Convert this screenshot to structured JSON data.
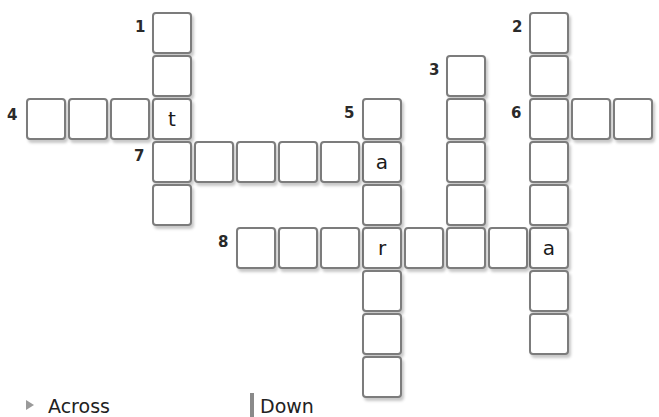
{
  "puzzle": {
    "type": "crossword",
    "clues": [
      {
        "number": "1",
        "direction": "down",
        "length": 5,
        "given": {}
      },
      {
        "number": "2",
        "direction": "down",
        "length": 8,
        "given": {
          "7": "a"
        }
      },
      {
        "number": "3",
        "direction": "down",
        "length": 4,
        "given": {}
      },
      {
        "number": "4",
        "direction": "across",
        "length": 4,
        "given": {
          "3": "t"
        }
      },
      {
        "number": "5",
        "direction": "down",
        "length": 7,
        "given": {
          "1": "a",
          "3": "r"
        }
      },
      {
        "number": "6",
        "direction": "across",
        "length": 3,
        "given": {}
      },
      {
        "number": "7",
        "direction": "across",
        "length": 6,
        "given": {
          "0": "t",
          "5": "a"
        }
      },
      {
        "number": "8",
        "direction": "across",
        "length": 8,
        "given": {
          "3": "r",
          "7": "a"
        }
      }
    ],
    "visible_letters": [
      "t",
      "a",
      "r",
      "a"
    ]
  },
  "legend": {
    "across_label": "Across",
    "down_label": "Down",
    "across_icon": "triangle-arrow-icon",
    "down_icon": "vertical-bar-icon"
  }
}
